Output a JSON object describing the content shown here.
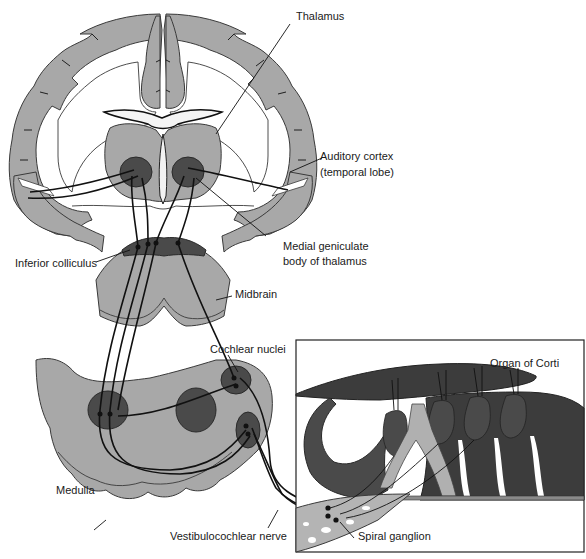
{
  "figure": {
    "colors": {
      "tissue_light": "#a8a8a8",
      "tissue_dark": "#4a4a4a",
      "nerve_line": "#111111",
      "background": "#ffffff"
    }
  },
  "labels": {
    "thalamus": "Thalamus",
    "auditory_cortex_line1": "Auditory cortex",
    "auditory_cortex_line2": "(temporal lobe)",
    "medial_geniculate_line1": "Medial geniculate",
    "medial_geniculate_line2": "body of thalamus",
    "inferior_colliculus": "Inferior colliculus",
    "midbrain": "Midbrain",
    "cochlear_nuclei": "Cochlear nuclei",
    "organ_of_corti": "Organ of Corti",
    "medulla": "Medulla",
    "vestibulocochlear_nerve": "Vestibulocochlear nerve",
    "spiral_ganglion": "Spiral ganglion"
  }
}
